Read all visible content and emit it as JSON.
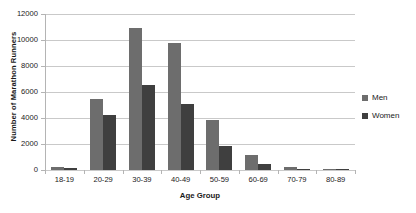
{
  "chart_data": {
    "type": "bar",
    "title": "",
    "xlabel": "Age Group",
    "ylabel": "Number of Marathon Runners",
    "categories": [
      "18-19",
      "20-29",
      "30-39",
      "40-49",
      "50-59",
      "60-69",
      "70-79",
      "80-89"
    ],
    "series": [
      {
        "name": "Men",
        "color": "#6d6d6d",
        "values": [
          260,
          5450,
          10900,
          9750,
          3850,
          1150,
          230,
          60
        ]
      },
      {
        "name": "Women",
        "color": "#3f3f3f",
        "values": [
          150,
          4200,
          6550,
          5100,
          1850,
          480,
          90,
          20
        ]
      }
    ],
    "ylim": [
      0,
      12000
    ],
    "yticks": [
      0,
      2000,
      4000,
      6000,
      8000,
      10000,
      12000
    ],
    "ytick_labels": [
      "0",
      "2000",
      "4000",
      "6000",
      "8000",
      "10000",
      "12000"
    ],
    "grid": "horizontal",
    "legend_position": "right"
  }
}
